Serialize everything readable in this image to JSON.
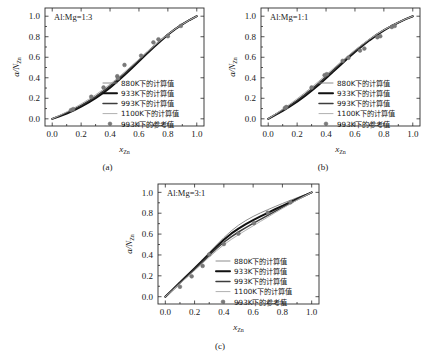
{
  "figure": {
    "panels": [
      {
        "id": "a",
        "caption": "(a)",
        "ratio_label": "Al:Mg=1:3",
        "xlabel_main": "x",
        "xlabel_sub": "Zn",
        "ylabel_main": "a/N",
        "ylabel_sub": "Zn"
      },
      {
        "id": "b",
        "caption": "(b)",
        "ratio_label": "Al:Mg=1:1",
        "xlabel_main": "x",
        "xlabel_sub": "Zn",
        "ylabel_main": "a/N",
        "ylabel_sub": "Zn"
      },
      {
        "id": "c",
        "caption": "(c)",
        "ratio_label": "Al:Mg=3:1",
        "xlabel_main": "x",
        "xlabel_sub": "Zn",
        "ylabel_main": "a/N",
        "ylabel_sub": "Zn"
      }
    ],
    "legend": [
      {
        "label": "880K下的计算值",
        "type": "line",
        "color": "#8c8c8c",
        "width": 1.0
      },
      {
        "label": "933K下的计算值",
        "type": "line",
        "color": "#101010",
        "width": 2.0
      },
      {
        "label": "993K下的计算值",
        "type": "line",
        "color": "#3d3d3d",
        "width": 1.5
      },
      {
        "label": "1100K下的计算值",
        "type": "line",
        "color": "#b0b0b0",
        "width": 1.0
      },
      {
        "label": "993K下的参考值",
        "type": "marker",
        "color": "#7a7a7a",
        "width": 0
      }
    ],
    "tick_labels": {
      "x": [
        "0.0",
        "0.2",
        "0.4",
        "0.6",
        "0.8",
        "1.0"
      ],
      "y": [
        "0.0",
        "0.2",
        "0.4",
        "0.6",
        "0.8",
        "1.0"
      ]
    }
  },
  "chart_data": [
    {
      "type": "line",
      "panel": "a",
      "title": "Al:Mg=1:3",
      "xlabel": "x_Zn",
      "ylabel": "a/N_Zn",
      "xlim": [
        -0.05,
        1.05
      ],
      "ylim": [
        -0.07,
        1.08
      ],
      "xticks": [
        0.0,
        0.2,
        0.4,
        0.6,
        0.8,
        1.0
      ],
      "yticks": [
        0.0,
        0.2,
        0.4,
        0.6,
        0.8,
        1.0
      ],
      "grid": false,
      "legend_position": "lower-right-inside",
      "x": [
        0.0,
        0.05,
        0.1,
        0.15,
        0.2,
        0.25,
        0.3,
        0.35,
        0.4,
        0.45,
        0.5,
        0.55,
        0.6,
        0.65,
        0.7,
        0.75,
        0.8,
        0.85,
        0.9,
        0.95,
        1.0
      ],
      "series": [
        {
          "name": "880K下的计算值",
          "color": "#8c8c8c",
          "values": [
            0.0,
            0.027,
            0.056,
            0.088,
            0.124,
            0.164,
            0.209,
            0.259,
            0.314,
            0.374,
            0.437,
            0.503,
            0.57,
            0.637,
            0.702,
            0.764,
            0.822,
            0.874,
            0.921,
            0.963,
            1.0
          ]
        },
        {
          "name": "933K下的计算值",
          "color": "#101010",
          "values": [
            0.0,
            0.025,
            0.052,
            0.083,
            0.118,
            0.157,
            0.201,
            0.25,
            0.304,
            0.363,
            0.426,
            0.492,
            0.56,
            0.628,
            0.695,
            0.759,
            0.819,
            0.873,
            0.921,
            0.963,
            1.0
          ]
        },
        {
          "name": "993K下的计算值",
          "color": "#3d3d3d",
          "values": [
            0.0,
            0.029,
            0.06,
            0.094,
            0.131,
            0.172,
            0.217,
            0.267,
            0.321,
            0.38,
            0.442,
            0.507,
            0.573,
            0.639,
            0.704,
            0.766,
            0.824,
            0.876,
            0.922,
            0.964,
            1.0
          ]
        },
        {
          "name": "1100K下的计算值",
          "color": "#b0b0b0",
          "values": [
            0.0,
            0.033,
            0.068,
            0.105,
            0.145,
            0.188,
            0.234,
            0.284,
            0.338,
            0.395,
            0.456,
            0.518,
            0.581,
            0.645,
            0.707,
            0.767,
            0.823,
            0.875,
            0.921,
            0.963,
            1.0
          ]
        }
      ],
      "scatter": {
        "name": "993K下的参考值",
        "color": "#7a7a7a",
        "points": [
          [
            0.13,
            0.085
          ],
          [
            0.145,
            0.095
          ],
          [
            0.27,
            0.215
          ],
          [
            0.355,
            0.305
          ],
          [
            0.45,
            0.415
          ],
          [
            0.455,
            0.395
          ],
          [
            0.5,
            0.525
          ],
          [
            0.615,
            0.615
          ],
          [
            0.7,
            0.745
          ],
          [
            0.735,
            0.775
          ],
          [
            0.8,
            0.805
          ],
          [
            0.89,
            0.905
          ]
        ]
      }
    },
    {
      "type": "line",
      "panel": "b",
      "title": "Al:Mg=1:1",
      "xlabel": "x_Zn",
      "ylabel": "a/N_Zn",
      "xlim": [
        -0.05,
        1.05
      ],
      "ylim": [
        -0.07,
        1.08
      ],
      "xticks": [
        0.0,
        0.2,
        0.4,
        0.6,
        0.8,
        1.0
      ],
      "yticks": [
        0.0,
        0.2,
        0.4,
        0.6,
        0.8,
        1.0
      ],
      "grid": false,
      "legend_position": "lower-right-inside",
      "x": [
        0.0,
        0.05,
        0.1,
        0.15,
        0.2,
        0.25,
        0.3,
        0.35,
        0.4,
        0.45,
        0.5,
        0.55,
        0.6,
        0.65,
        0.7,
        0.75,
        0.8,
        0.85,
        0.9,
        0.95,
        1.0
      ],
      "series": [
        {
          "name": "880K下的计算值",
          "color": "#8c8c8c",
          "values": [
            0.0,
            0.04,
            0.082,
            0.127,
            0.175,
            0.227,
            0.283,
            0.343,
            0.406,
            0.47,
            0.535,
            0.598,
            0.659,
            0.717,
            0.771,
            0.82,
            0.864,
            0.903,
            0.938,
            0.971,
            1.0
          ]
        },
        {
          "name": "933K下的计算值",
          "color": "#101010",
          "values": [
            0.0,
            0.038,
            0.078,
            0.121,
            0.168,
            0.219,
            0.274,
            0.333,
            0.396,
            0.46,
            0.525,
            0.589,
            0.651,
            0.71,
            0.765,
            0.816,
            0.861,
            0.902,
            0.938,
            0.971,
            1.0
          ]
        },
        {
          "name": "993K下的计算值",
          "color": "#3d3d3d",
          "values": [
            0.0,
            0.042,
            0.086,
            0.132,
            0.181,
            0.234,
            0.29,
            0.349,
            0.411,
            0.475,
            0.539,
            0.602,
            0.662,
            0.719,
            0.773,
            0.822,
            0.866,
            0.904,
            0.939,
            0.971,
            1.0
          ]
        },
        {
          "name": "1100K下的计算值",
          "color": "#b0b0b0",
          "values": [
            0.0,
            0.046,
            0.094,
            0.144,
            0.196,
            0.251,
            0.308,
            0.367,
            0.428,
            0.49,
            0.552,
            0.612,
            0.67,
            0.725,
            0.776,
            0.824,
            0.867,
            0.905,
            0.94,
            0.972,
            1.0
          ]
        }
      ],
      "scatter": {
        "name": "993K下的参考值",
        "color": "#7a7a7a",
        "points": [
          [
            0.115,
            0.105
          ],
          [
            0.125,
            0.115
          ],
          [
            0.3,
            0.305
          ],
          [
            0.39,
            0.425
          ],
          [
            0.405,
            0.435
          ],
          [
            0.515,
            0.565
          ],
          [
            0.555,
            0.595
          ],
          [
            0.635,
            0.665
          ],
          [
            0.665,
            0.685
          ],
          [
            0.755,
            0.795
          ],
          [
            0.775,
            0.805
          ],
          [
            0.855,
            0.895
          ],
          [
            0.875,
            0.905
          ]
        ]
      }
    },
    {
      "type": "line",
      "panel": "c",
      "title": "Al:Mg=3:1",
      "xlabel": "x_Zn",
      "ylabel": "a/N_Zn",
      "xlim": [
        -0.05,
        1.05
      ],
      "ylim": [
        -0.07,
        1.08
      ],
      "xticks": [
        0.0,
        0.2,
        0.4,
        0.6,
        0.8,
        1.0
      ],
      "yticks": [
        0.0,
        0.2,
        0.4,
        0.6,
        0.8,
        1.0
      ],
      "grid": false,
      "legend_position": "lower-right-inside",
      "x": [
        0.0,
        0.05,
        0.1,
        0.15,
        0.2,
        0.25,
        0.3,
        0.35,
        0.4,
        0.45,
        0.5,
        0.55,
        0.6,
        0.65,
        0.7,
        0.75,
        0.8,
        0.85,
        0.9,
        0.95,
        1.0
      ],
      "series": [
        {
          "name": "880K下的计算值",
          "color": "#8c8c8c",
          "values": [
            0.0,
            0.072,
            0.143,
            0.212,
            0.282,
            0.352,
            0.424,
            0.496,
            0.566,
            0.63,
            0.685,
            0.73,
            0.769,
            0.803,
            0.834,
            0.864,
            0.893,
            0.921,
            0.948,
            0.975,
            1.0
          ]
        },
        {
          "name": "933K下的计算值",
          "color": "#101010",
          "values": [
            0.0,
            0.068,
            0.136,
            0.203,
            0.271,
            0.34,
            0.41,
            0.48,
            0.546,
            0.604,
            0.653,
            0.695,
            0.733,
            0.769,
            0.804,
            0.838,
            0.871,
            0.903,
            0.936,
            0.968,
            1.0
          ]
        },
        {
          "name": "993K下的计算值",
          "color": "#3d3d3d",
          "values": [
            0.0,
            0.065,
            0.131,
            0.196,
            0.262,
            0.329,
            0.396,
            0.462,
            0.522,
            0.574,
            0.62,
            0.662,
            0.702,
            0.741,
            0.78,
            0.818,
            0.856,
            0.893,
            0.93,
            0.965,
            1.0
          ]
        },
        {
          "name": "1100K下的计算值",
          "color": "#b0b0b0",
          "values": [
            0.0,
            0.062,
            0.125,
            0.188,
            0.251,
            0.315,
            0.379,
            0.441,
            0.498,
            0.548,
            0.594,
            0.637,
            0.679,
            0.721,
            0.763,
            0.805,
            0.846,
            0.886,
            0.925,
            0.963,
            1.0
          ]
        }
      ],
      "scatter": {
        "name": "993K下的参考值",
        "color": "#7a7a7a",
        "points": [
          [
            0.1,
            0.095
          ],
          [
            0.18,
            0.195
          ],
          [
            0.255,
            0.295
          ],
          [
            0.3,
            0.405
          ],
          [
            0.4,
            0.505
          ],
          [
            0.5,
            0.605
          ],
          [
            0.605,
            0.705
          ],
          [
            0.7,
            0.805
          ],
          [
            0.855,
            0.905
          ]
        ]
      }
    }
  ]
}
